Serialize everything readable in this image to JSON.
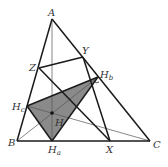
{
  "diagram": {
    "type": "geometry",
    "colors": {
      "line": "#1a1a1a",
      "thin_line": "#555555",
      "fill": "#8a8a8a",
      "label": "#333333"
    },
    "points": {
      "A": {
        "x": 52,
        "y": 19
      },
      "B": {
        "x": 17,
        "y": 141
      },
      "C": {
        "x": 150,
        "y": 141
      },
      "X": {
        "x": 110,
        "y": 141
      },
      "Y": {
        "x": 83,
        "y": 57
      },
      "Z": {
        "x": 39,
        "y": 68
      },
      "Ha": {
        "x": 52,
        "y": 141
      },
      "Hb": {
        "x": 98,
        "y": 77
      },
      "Hc": {
        "x": 27,
        "y": 106
      },
      "H": {
        "x": 52,
        "y": 113
      }
    },
    "labels": {
      "A": "A",
      "B": "B",
      "C": "C",
      "X": "X",
      "Y": "Y",
      "Z": "Z",
      "H": "H",
      "Ha_main": "H",
      "Ha_sub": "a",
      "Hb_main": "H",
      "Hb_sub": "b",
      "Hc_main": "H",
      "Hc_sub": "c"
    },
    "segments_thick": [
      [
        "A",
        "B"
      ],
      [
        "B",
        "C"
      ],
      [
        "C",
        "A"
      ],
      [
        "Z",
        "Y"
      ],
      [
        "Z",
        "X"
      ],
      [
        "Y",
        "X"
      ],
      [
        "Hc",
        "Hb"
      ],
      [
        "Hc",
        "Ha"
      ],
      [
        "Ha",
        "Hb"
      ]
    ],
    "segments_thin": [
      [
        "A",
        "Ha"
      ],
      [
        "B",
        "Hb"
      ],
      [
        "C",
        "Hc"
      ]
    ],
    "filled_polygon": [
      "Ha",
      "Hb",
      "Hc"
    ]
  }
}
